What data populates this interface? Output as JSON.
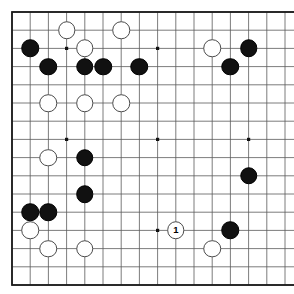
{
  "board": {
    "title": "Go board diagram",
    "background_color": "#ffffff",
    "line_color": "#5a5a5a",
    "border_color": "#1a1a1a",
    "black_color": "#111111",
    "white_color": "#ffffff",
    "grid": {
      "columns": 17,
      "rows": 16,
      "left": 12,
      "top": 12,
      "spacing": 18.2
    },
    "star_points": [
      {
        "col": 3,
        "row": 2
      },
      {
        "col": 8,
        "row": 2
      },
      {
        "col": 13,
        "row": 2
      },
      {
        "col": 3,
        "row": 7
      },
      {
        "col": 8,
        "row": 7
      },
      {
        "col": 13,
        "row": 7
      },
      {
        "col": 8,
        "row": 12
      }
    ],
    "stones": [
      {
        "color": "black",
        "col": 1,
        "row": 2,
        "label": ""
      },
      {
        "color": "white",
        "col": 3,
        "row": 1,
        "label": ""
      },
      {
        "color": "white",
        "col": 6,
        "row": 1,
        "label": ""
      },
      {
        "color": "white",
        "col": 4,
        "row": 2,
        "label": ""
      },
      {
        "color": "white",
        "col": 11,
        "row": 2,
        "label": ""
      },
      {
        "color": "black",
        "col": 13,
        "row": 2,
        "label": ""
      },
      {
        "color": "black",
        "col": 2,
        "row": 3,
        "label": ""
      },
      {
        "color": "black",
        "col": 4,
        "row": 3,
        "label": ""
      },
      {
        "color": "black",
        "col": 5,
        "row": 3,
        "label": ""
      },
      {
        "color": "black",
        "col": 7,
        "row": 3,
        "label": ""
      },
      {
        "color": "black",
        "col": 12,
        "row": 3,
        "label": ""
      },
      {
        "color": "white",
        "col": 2,
        "row": 5,
        "label": ""
      },
      {
        "color": "white",
        "col": 4,
        "row": 5,
        "label": ""
      },
      {
        "color": "white",
        "col": 6,
        "row": 5,
        "label": ""
      },
      {
        "color": "white",
        "col": 2,
        "row": 8,
        "label": ""
      },
      {
        "color": "black",
        "col": 4,
        "row": 8,
        "label": ""
      },
      {
        "color": "black",
        "col": 4,
        "row": 10,
        "label": ""
      },
      {
        "color": "black",
        "col": 13,
        "row": 9,
        "label": ""
      },
      {
        "color": "black",
        "col": 1,
        "row": 11,
        "label": ""
      },
      {
        "color": "black",
        "col": 2,
        "row": 11,
        "label": ""
      },
      {
        "color": "white",
        "col": 1,
        "row": 12,
        "label": ""
      },
      {
        "color": "white",
        "col": 2,
        "row": 13,
        "label": ""
      },
      {
        "color": "white",
        "col": 4,
        "row": 13,
        "label": ""
      },
      {
        "color": "white",
        "col": 9,
        "row": 12,
        "label": "1"
      },
      {
        "color": "black",
        "col": 12,
        "row": 12,
        "label": ""
      },
      {
        "color": "white",
        "col": 11,
        "row": 13,
        "label": ""
      }
    ],
    "stone_diameter": 17.5,
    "move_marker": {
      "number": "1",
      "color": "white",
      "col": 9,
      "row": 12
    }
  }
}
